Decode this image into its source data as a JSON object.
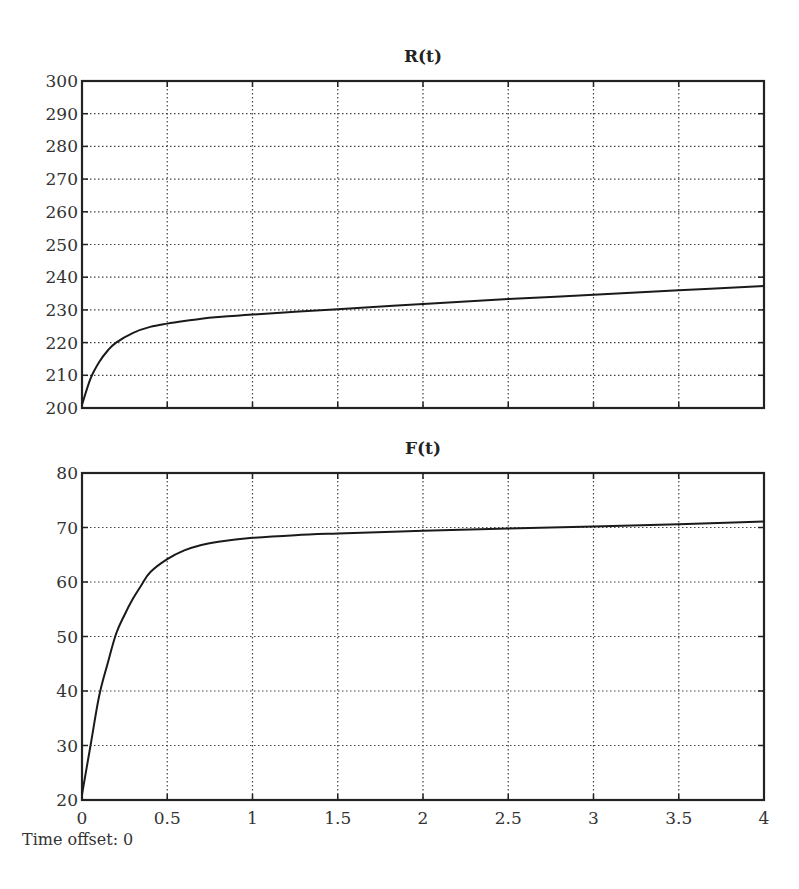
{
  "chart_data": [
    {
      "type": "line",
      "title": "R(t)",
      "xlabel": "",
      "ylabel": "",
      "xlim": [
        0,
        4
      ],
      "ylim": [
        200,
        300
      ],
      "x_ticks": [
        0,
        0.5,
        1,
        1.5,
        2,
        2.5,
        3,
        3.5,
        4
      ],
      "y_ticks": [
        200,
        210,
        220,
        230,
        240,
        250,
        260,
        270,
        280,
        290,
        300
      ],
      "grid": true,
      "legend": "none",
      "series": [
        {
          "name": "R(t)",
          "x": [
            0,
            0.05,
            0.1,
            0.15,
            0.2,
            0.3,
            0.4,
            0.5,
            0.6,
            0.7,
            0.8,
            1.0,
            1.25,
            1.5,
            2.0,
            2.5,
            3.0,
            3.5,
            4.0
          ],
          "y": [
            201,
            209,
            214,
            217.5,
            220,
            223,
            224.8,
            225.8,
            226.6,
            227.3,
            227.8,
            228.6,
            229.4,
            230.2,
            231.8,
            233.3,
            234.6,
            236,
            237.3
          ]
        }
      ]
    },
    {
      "type": "line",
      "title": "F(t)",
      "xlabel": "",
      "ylabel": "",
      "xlim": [
        0,
        4
      ],
      "ylim": [
        20,
        80
      ],
      "x_ticks": [
        0,
        0.5,
        1,
        1.5,
        2,
        2.5,
        3,
        3.5,
        4
      ],
      "y_ticks": [
        20,
        30,
        40,
        50,
        60,
        70,
        80
      ],
      "grid": true,
      "legend": "none",
      "series": [
        {
          "name": "F(t)",
          "x": [
            0,
            0.05,
            0.1,
            0.15,
            0.2,
            0.25,
            0.3,
            0.35,
            0.4,
            0.5,
            0.6,
            0.7,
            0.8,
            1.0,
            1.25,
            1.5,
            2.0,
            2.5,
            3.0,
            3.5,
            4.0
          ],
          "y": [
            21,
            30,
            39,
            45,
            50.5,
            54,
            57,
            59.5,
            61.8,
            64.2,
            65.8,
            66.8,
            67.4,
            68.1,
            68.6,
            68.9,
            69.4,
            69.8,
            70.2,
            70.6,
            71.1
          ]
        }
      ]
    }
  ],
  "footer": {
    "time_offset_label": "Time offset: 0"
  }
}
